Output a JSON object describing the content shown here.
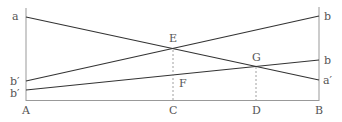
{
  "diagram": {
    "colors": {
      "line": "#333333",
      "axis": "#888888",
      "dashed": "#888888",
      "label": "#555555"
    },
    "labels": {
      "a": "a",
      "b_prime_upper": "b′",
      "b_prime_lower": "b′",
      "A": "A",
      "b_top": "b",
      "b_mid": "b",
      "a_prime": "a′",
      "B": "B",
      "C": "C",
      "D": "D",
      "E": "E",
      "F": "F",
      "G": "G"
    },
    "points": {
      "A": [
        26,
        100
      ],
      "B": [
        319,
        100
      ],
      "a": [
        26,
        17
      ],
      "a_prime": [
        319,
        80
      ],
      "b_prime_upper": [
        26,
        81
      ],
      "b_top": [
        319,
        16
      ],
      "b_prime_lower": [
        26,
        90
      ],
      "b_mid": [
        319,
        60
      ],
      "E": [
        173,
        48
      ],
      "G": [
        256,
        66
      ],
      "C": [
        173,
        100
      ],
      "D": [
        256,
        100
      ]
    },
    "lines": [
      {
        "name": "line-a-aprime",
        "from": "a",
        "to": "a′"
      },
      {
        "name": "line-bprime-b-top",
        "from": "b′",
        "to": "b"
      },
      {
        "name": "line-bprime-b-mid",
        "from": "b′",
        "to": "b"
      }
    ]
  }
}
